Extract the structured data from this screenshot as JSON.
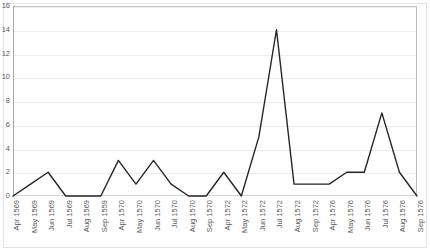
{
  "chart_data": {
    "type": "line",
    "title": "",
    "subtitle": "",
    "xlabel": "",
    "ylabel": "",
    "ylim": [
      0,
      16
    ],
    "yticks": [
      0,
      2,
      4,
      6,
      8,
      10,
      12,
      14,
      16
    ],
    "grid": true,
    "legend": "none",
    "line_color": "#262626",
    "categories": [
      "Apr 1569",
      "May 1569",
      "Jun 1569",
      "Jul 1569",
      "Aug 1569",
      "Sep 1559",
      "Apr 1570",
      "May 1570",
      "Jun 1570",
      "Jul 1570",
      "Aug 1570",
      "Sep 1570",
      "Apr 1572",
      "May 1572",
      "Jun 1572",
      "Jul 1572",
      "Aug 1572",
      "Sep 1572",
      "Apr 1576",
      "May 1576",
      "Jun 1576",
      "Jul 1576",
      "Aug 1576",
      "Sep 1576"
    ],
    "values": [
      0,
      1,
      2,
      0,
      0,
      0,
      3,
      1,
      3,
      1,
      0,
      0,
      2,
      0,
      5,
      14,
      1,
      1,
      1,
      2,
      2,
      7,
      2,
      0
    ],
    "series": [
      {
        "name": "count",
        "values": [
          0,
          1,
          2,
          0,
          0,
          0,
          3,
          1,
          3,
          1,
          0,
          0,
          2,
          0,
          5,
          14,
          1,
          1,
          1,
          2,
          2,
          7,
          2,
          0
        ]
      }
    ]
  }
}
